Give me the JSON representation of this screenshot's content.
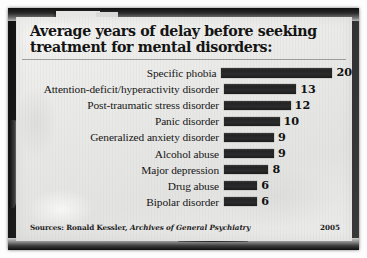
{
  "figure": {
    "title_line1": "Average years of delay before seeking",
    "title_line2": "treatment for mental disorders:",
    "source_prefix": "Sources: Ronald Kessler,",
    "source_journal": "Archives of General Psychiatry",
    "year": "2005",
    "paper_color": "#e9e9e7",
    "bar_color": "#272727",
    "text_color": "#161616",
    "frame_color": "#1a1a1a"
  },
  "chart_data": {
    "type": "bar",
    "orientation": "horizontal",
    "title": "Average years of delay before seeking treatment for mental disorders:",
    "xlabel": "",
    "ylabel": "",
    "xlim": [
      0,
      20
    ],
    "grid": false,
    "legend": false,
    "value_labels": true,
    "units": "years",
    "categories": [
      "Specific phobia",
      "Attention-deficit/hyperactivity disorder",
      "Post-traumatic stress disorder",
      "Panic disorder",
      "Generalized anxiety disorder",
      "Alcohol abuse",
      "Major depression",
      "Drug abuse",
      "Bipolar disorder"
    ],
    "values": [
      20,
      13,
      12,
      10,
      9,
      9,
      8,
      6,
      6
    ],
    "labels": [
      "20",
      "13",
      "12",
      "10",
      "9",
      "9",
      "8",
      "6",
      "6"
    ]
  }
}
